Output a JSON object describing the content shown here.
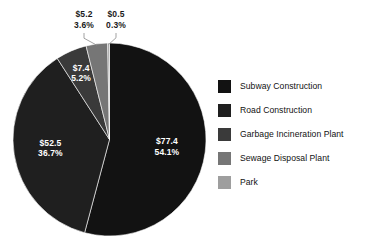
{
  "chart_data": {
    "type": "pie",
    "title": "",
    "subtitle": "",
    "xlabel": "",
    "ylabel": "",
    "grid": false,
    "legend_position": "right",
    "value_prefix": "$",
    "categories": [
      "Subway Construction",
      "Road Construction",
      "Garbage Incineration Plant",
      "Sewage Disposal Plant",
      "Park"
    ],
    "values": [
      77.4,
      52.5,
      7.4,
      5.2,
      0.5
    ],
    "percents": [
      54.1,
      36.7,
      5.2,
      3.6,
      0.3
    ],
    "colors": [
      "#121212",
      "#1f1f1f",
      "#3a3a3a",
      "#767676",
      "#9e9e9e"
    ],
    "slices": [
      {
        "label": "Subway Construction",
        "value": 77.4,
        "value_text": "$77.4",
        "percent": 54.1,
        "percent_text": "54.1%",
        "color": "#121212",
        "label_placement": "inside"
      },
      {
        "label": "Road Construction",
        "value": 52.5,
        "value_text": "$52.5",
        "percent": 36.7,
        "percent_text": "36.7%",
        "color": "#1f1f1f",
        "label_placement": "inside"
      },
      {
        "label": "Garbage Incineration Plant",
        "value": 7.4,
        "value_text": "$7.4",
        "percent": 5.2,
        "percent_text": "5.2%",
        "color": "#3a3a3a",
        "label_placement": "inside"
      },
      {
        "label": "Sewage Disposal Plant",
        "value": 5.2,
        "value_text": "$5.2",
        "percent": 3.6,
        "percent_text": "3.6%",
        "color": "#767676",
        "label_placement": "outside"
      },
      {
        "label": "Park",
        "value": 0.5,
        "value_text": "$0.5",
        "percent": 0.3,
        "percent_text": "0.3%",
        "color": "#9e9e9e",
        "label_placement": "outside"
      }
    ]
  },
  "legend": {
    "items": [
      {
        "label": "Subway Construction",
        "color": "#121212"
      },
      {
        "label": "Road Construction",
        "color": "#1f1f1f"
      },
      {
        "label": "Garbage Incineration Plant",
        "color": "#3a3a3a"
      },
      {
        "label": "Sewage Disposal Plant",
        "color": "#767676"
      },
      {
        "label": "Park",
        "color": "#9e9e9e"
      }
    ]
  }
}
